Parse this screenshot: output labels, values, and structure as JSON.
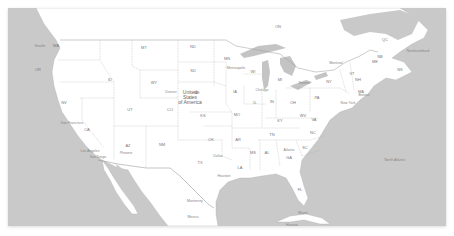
{
  "map": {
    "title": "United States of America",
    "country_label": "United\nStates\nof America",
    "colors": {
      "water": "#c9c9c9",
      "land": "#ffffff",
      "lake": "#c4c4c4",
      "border": "#9a9a9a",
      "label": "#777777"
    },
    "states": [
      {
        "abbr": "WA",
        "x": 56,
        "y": 46
      },
      {
        "abbr": "OR",
        "x": 38,
        "y": 70
      },
      {
        "abbr": "CA",
        "x": 87,
        "y": 130
      },
      {
        "abbr": "NV",
        "x": 64,
        "y": 103
      },
      {
        "abbr": "ID",
        "x": 110,
        "y": 80
      },
      {
        "abbr": "MT",
        "x": 144,
        "y": 48
      },
      {
        "abbr": "WY",
        "x": 154,
        "y": 83
      },
      {
        "abbr": "UT",
        "x": 130,
        "y": 110
      },
      {
        "abbr": "AZ",
        "x": 128,
        "y": 146
      },
      {
        "abbr": "NM",
        "x": 162,
        "y": 145
      },
      {
        "abbr": "CO",
        "x": 170,
        "y": 110
      },
      {
        "abbr": "ND",
        "x": 193,
        "y": 47
      },
      {
        "abbr": "SD",
        "x": 193,
        "y": 71
      },
      {
        "abbr": "NE",
        "x": 197,
        "y": 93
      },
      {
        "abbr": "KS",
        "x": 203,
        "y": 116
      },
      {
        "abbr": "OK",
        "x": 211,
        "y": 140
      },
      {
        "abbr": "TX",
        "x": 200,
        "y": 163
      },
      {
        "abbr": "MN",
        "x": 227,
        "y": 59
      },
      {
        "abbr": "IA",
        "x": 235,
        "y": 92
      },
      {
        "abbr": "MO",
        "x": 237,
        "y": 115
      },
      {
        "abbr": "AR",
        "x": 238,
        "y": 140
      },
      {
        "abbr": "LA",
        "x": 240,
        "y": 168
      },
      {
        "abbr": "WI",
        "x": 253,
        "y": 72
      },
      {
        "abbr": "IL",
        "x": 255,
        "y": 103
      },
      {
        "abbr": "MI",
        "x": 280,
        "y": 80
      },
      {
        "abbr": "IN",
        "x": 272,
        "y": 102
      },
      {
        "abbr": "OH",
        "x": 293,
        "y": 103
      },
      {
        "abbr": "KY",
        "x": 280,
        "y": 121
      },
      {
        "abbr": "TN",
        "x": 272,
        "y": 135
      },
      {
        "abbr": "MS",
        "x": 253,
        "y": 153
      },
      {
        "abbr": "AL",
        "x": 267,
        "y": 153
      },
      {
        "abbr": "GA",
        "x": 289,
        "y": 158
      },
      {
        "abbr": "FL",
        "x": 300,
        "y": 190
      },
      {
        "abbr": "SC",
        "x": 305,
        "y": 148
      },
      {
        "abbr": "NC",
        "x": 313,
        "y": 133
      },
      {
        "abbr": "VA",
        "x": 314,
        "y": 120
      },
      {
        "abbr": "WV",
        "x": 303,
        "y": 116
      },
      {
        "abbr": "PA",
        "x": 317,
        "y": 98
      },
      {
        "abbr": "NY",
        "x": 329,
        "y": 82
      },
      {
        "abbr": "VT",
        "x": 352,
        "y": 74
      },
      {
        "abbr": "NH",
        "x": 358,
        "y": 80
      },
      {
        "abbr": "ME",
        "x": 375,
        "y": 62
      },
      {
        "abbr": "MA",
        "x": 361,
        "y": 92
      },
      {
        "abbr": "ON",
        "x": 278,
        "y": 27
      },
      {
        "abbr": "QC",
        "x": 385,
        "y": 40
      },
      {
        "abbr": "NB",
        "x": 380,
        "y": 57
      },
      {
        "abbr": "NS",
        "x": 400,
        "y": 70
      }
    ],
    "cities": [
      {
        "name": "Seattle",
        "x": 40,
        "y": 47
      },
      {
        "name": "San Francisco",
        "x": 72,
        "y": 124
      },
      {
        "name": "Los Angeles",
        "x": 90,
        "y": 152
      },
      {
        "name": "San Diego",
        "x": 98,
        "y": 158
      },
      {
        "name": "Phoenix",
        "x": 126,
        "y": 154
      },
      {
        "name": "Denver",
        "x": 171,
        "y": 93
      },
      {
        "name": "Dallas",
        "x": 218,
        "y": 157
      },
      {
        "name": "Houston",
        "x": 224,
        "y": 177
      },
      {
        "name": "Atlanta",
        "x": 289,
        "y": 151
      },
      {
        "name": "Miami",
        "x": 303,
        "y": 214
      },
      {
        "name": "Minneapolis",
        "x": 236,
        "y": 69
      },
      {
        "name": "Chicago",
        "x": 262,
        "y": 91
      },
      {
        "name": "Monterrey",
        "x": 195,
        "y": 202
      },
      {
        "name": "Mexico",
        "x": 193,
        "y": 218
      },
      {
        "name": "Toronto",
        "x": 304,
        "y": 84
      },
      {
        "name": "Montreal",
        "x": 336,
        "y": 64
      },
      {
        "name": "Boston",
        "x": 364,
        "y": 96
      },
      {
        "name": "New York",
        "x": 348,
        "y": 104
      },
      {
        "name": "Havana",
        "x": 292,
        "y": 226
      },
      {
        "name": "Newfoundland",
        "x": 418,
        "y": 52
      },
      {
        "name": "North Atlantic",
        "x": 395,
        "y": 161
      }
    ]
  }
}
